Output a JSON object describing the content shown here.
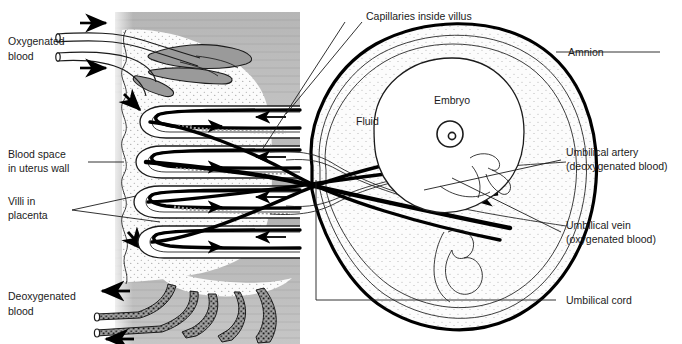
{
  "diagram": {
    "background_color": "#ffffff",
    "ink_color": "#1b1b1b"
  },
  "regions": {
    "uterus_wall": {
      "name": "uterus-wall",
      "fill": "#b9b9b9",
      "texture": "horizontal-bands"
    },
    "blood_space": {
      "name": "maternal-blood-space",
      "fill": "#f3f3f3",
      "texture": "fine-stipple"
    },
    "amniotic_sac": {
      "name": "amniotic-sac",
      "fill": "#f7f7f7",
      "texture": "fine-stipple"
    },
    "embryo_body": {
      "name": "embryo",
      "fill": "#ffffff"
    }
  },
  "labels": {
    "oxygenated_blood": {
      "line1": "Oxygenated",
      "line2": "blood"
    },
    "blood_space": {
      "line1": "Blood space",
      "line2": "in uterus wall"
    },
    "villi": {
      "line1": "Villi in",
      "line2": "placenta"
    },
    "deoxygenated_blood": {
      "line1": "Deoxygenated",
      "line2": "blood"
    },
    "capillaries": {
      "line1": "Capillaries inside villus"
    },
    "amnion": {
      "line1": "Amnion"
    },
    "umbilical_artery": {
      "line1": "Umbilical artery",
      "line2": "(deoxygenated blood)"
    },
    "umbilical_vein": {
      "line1": "Umbilical vein",
      "line2": "(oxygenated blood)"
    },
    "umbilical_cord": {
      "line1": "Umbilical cord"
    },
    "embryo": {
      "line1": "Embryo"
    },
    "fluid": {
      "line1": "Fluid"
    }
  },
  "flow_arrows": {
    "maternal_in_top": "right",
    "maternal_in_second": "right",
    "maternal_descend_upper": "down-left",
    "maternal_descend_lower": "down-right",
    "maternal_out_upper": "left",
    "maternal_out_lower": "left",
    "villus_capillary_in": "right",
    "villus_capillary_out": "left",
    "cord_artery": "left"
  }
}
